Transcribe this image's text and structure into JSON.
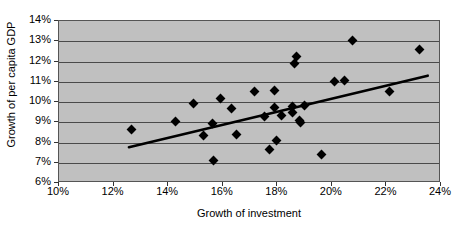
{
  "chart_data": {
    "type": "scatter",
    "title": "",
    "xlabel": "Growth of investment",
    "ylabel": "Growth of per capita GDP",
    "xlim": [
      10,
      24
    ],
    "ylim": [
      6,
      14
    ],
    "xticks": [
      "10%",
      "12%",
      "14%",
      "16%",
      "18%",
      "20%",
      "22%",
      "24%"
    ],
    "xtick_values": [
      10,
      12,
      14,
      16,
      18,
      20,
      22,
      24
    ],
    "yticks": [
      "6%",
      "7%",
      "8%",
      "9%",
      "10%",
      "11%",
      "12%",
      "13%",
      "14%"
    ],
    "ytick_values": [
      6,
      7,
      8,
      9,
      10,
      11,
      12,
      13,
      14
    ],
    "grid": true,
    "grid_axis": "y",
    "legend": false,
    "marker_shape": "diamond",
    "marker_color": "#000000",
    "plot_background": "#c0c0c0",
    "points": [
      {
        "x": 12.7,
        "y": 8.6
      },
      {
        "x": 14.3,
        "y": 8.97
      },
      {
        "x": 14.95,
        "y": 9.9
      },
      {
        "x": 15.35,
        "y": 8.28
      },
      {
        "x": 15.65,
        "y": 8.9
      },
      {
        "x": 15.7,
        "y": 7.08
      },
      {
        "x": 15.95,
        "y": 10.1
      },
      {
        "x": 16.35,
        "y": 9.62
      },
      {
        "x": 16.55,
        "y": 8.35
      },
      {
        "x": 17.2,
        "y": 10.48
      },
      {
        "x": 17.55,
        "y": 9.23
      },
      {
        "x": 17.75,
        "y": 7.62
      },
      {
        "x": 17.95,
        "y": 10.53
      },
      {
        "x": 17.95,
        "y": 9.7
      },
      {
        "x": 18.0,
        "y": 8.05
      },
      {
        "x": 18.2,
        "y": 9.3
      },
      {
        "x": 18.6,
        "y": 9.72
      },
      {
        "x": 18.6,
        "y": 9.45
      },
      {
        "x": 18.65,
        "y": 11.85
      },
      {
        "x": 18.75,
        "y": 12.2
      },
      {
        "x": 18.85,
        "y": 9.05
      },
      {
        "x": 18.9,
        "y": 8.92
      },
      {
        "x": 19.05,
        "y": 9.8
      },
      {
        "x": 19.65,
        "y": 7.37
      },
      {
        "x": 20.15,
        "y": 10.95
      },
      {
        "x": 20.5,
        "y": 11.0
      },
      {
        "x": 20.8,
        "y": 12.98
      },
      {
        "x": 22.15,
        "y": 10.45
      },
      {
        "x": 23.25,
        "y": 12.55
      }
    ],
    "trendline": {
      "type": "linear",
      "x_start": 12.6,
      "y_start": 7.72,
      "x_end": 23.55,
      "y_end": 11.25,
      "color": "#000000",
      "width": 2.6
    }
  }
}
